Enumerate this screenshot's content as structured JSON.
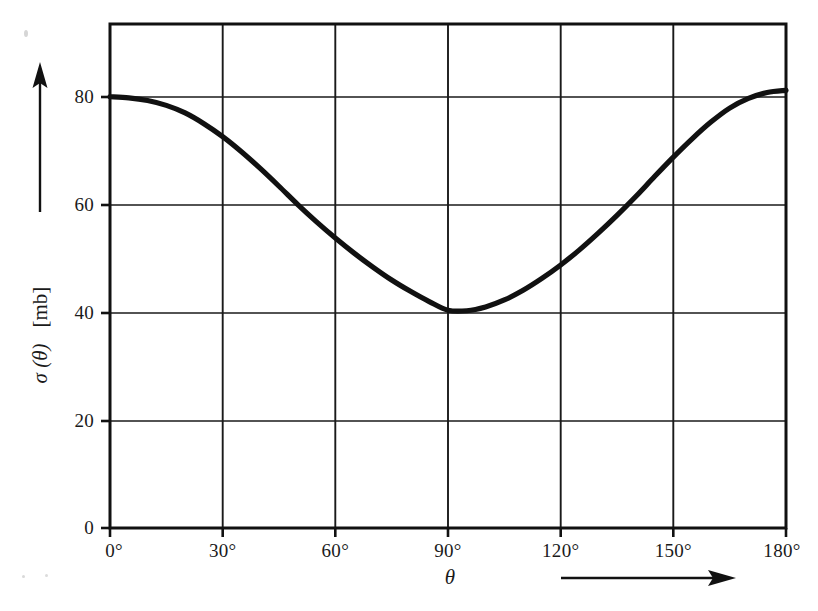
{
  "chart_data": {
    "type": "line",
    "title": "",
    "subtitle": "",
    "xlabel": "θ",
    "ylabel": "σ (θ)",
    "yunit": "[mb]",
    "xtick_labels": [
      "0°",
      "30°",
      "60°",
      "90°",
      "120°",
      "150°",
      "180°"
    ],
    "xticks": [
      0,
      30,
      60,
      90,
      120,
      150,
      180
    ],
    "ytick_labels": [
      "0",
      "20",
      "40",
      "60",
      "80"
    ],
    "yticks": [
      0,
      20,
      40,
      60,
      80
    ],
    "xlim": [
      0,
      180
    ],
    "ylim": [
      0,
      93.5
    ],
    "grid": true,
    "legend": "none",
    "line_color": "#111111",
    "grid_color": "#1a1a1a",
    "x": [
      0,
      5,
      10,
      15,
      20,
      25,
      30,
      35,
      40,
      45,
      50,
      55,
      60,
      65,
      70,
      75,
      80,
      85,
      90,
      95,
      100,
      105,
      110,
      115,
      120,
      125,
      130,
      135,
      140,
      145,
      150,
      155,
      160,
      165,
      170,
      175,
      180
    ],
    "values": [
      80.0,
      79.8,
      79.3,
      78.4,
      77.0,
      75.0,
      72.6,
      69.8,
      66.7,
      63.4,
      60.0,
      56.8,
      53.8,
      51.0,
      48.4,
      46.0,
      43.9,
      42.0,
      40.4,
      40.3,
      41.0,
      42.3,
      44.1,
      46.3,
      48.8,
      51.6,
      54.7,
      58.0,
      61.5,
      65.2,
      68.8,
      72.2,
      75.3,
      77.9,
      79.7,
      80.8,
      81.2
    ],
    "annotations": {
      "y_axis_arrow": "up-arrow",
      "x_axis_arrow": "right-arrow"
    }
  },
  "geometry": {
    "plot_left": 110,
    "plot_right": 786,
    "plot_top": 24,
    "plot_bottom": 528
  }
}
